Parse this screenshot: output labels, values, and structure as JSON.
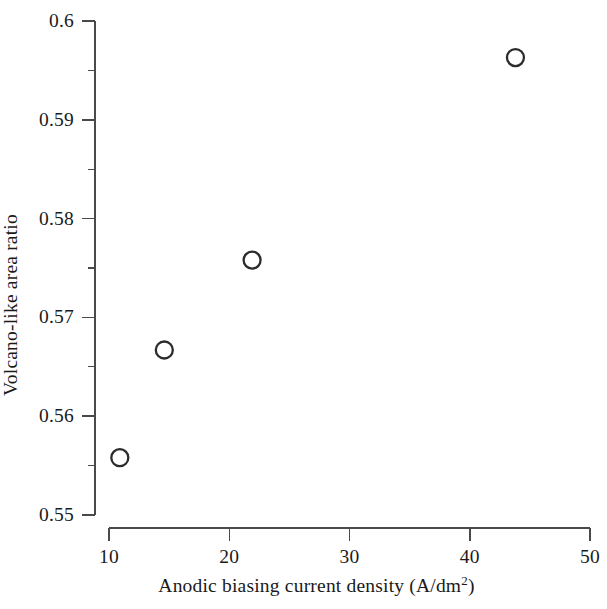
{
  "chart_data": {
    "type": "scatter",
    "title": "",
    "xlabel": "Anodic biasing current density (A/dm2)",
    "xlabel_base": "Anodic biasing current density (A/dm",
    "xlabel_sup": "2",
    "xlabel_tail": ")",
    "ylabel": "Volcano-like area ratio",
    "xlim": [
      10,
      50
    ],
    "ylim": [
      0.55,
      0.6
    ],
    "xticks": [
      10,
      20,
      30,
      40,
      50
    ],
    "xtick_labels": [
      "10",
      "20",
      "30",
      "40",
      "50"
    ],
    "yticks": [
      0.55,
      0.56,
      0.57,
      0.58,
      0.59,
      0.6
    ],
    "ytick_labels": [
      "0.55",
      "0.56",
      "0.57",
      "0.58",
      "0.59",
      "0.6"
    ],
    "y_minor_ticks": [
      0.555,
      0.565,
      0.575,
      0.585,
      0.595
    ],
    "x_minor_ticks": [],
    "grid": false,
    "legend": null,
    "marker": "open-circle",
    "marker_color": "#2b2b2b",
    "marker_fill": "none",
    "x": [
      10.9,
      14.6,
      21.9,
      43.8
    ],
    "y": [
      0.5558,
      0.5667,
      0.5758,
      0.5963
    ],
    "points": [
      {
        "x": 10.9,
        "y": 0.5558
      },
      {
        "x": 14.6,
        "y": 0.5667
      },
      {
        "x": 21.9,
        "y": 0.5758
      },
      {
        "x": 43.8,
        "y": 0.5963
      }
    ],
    "axis_color": "#4a4a4a"
  }
}
